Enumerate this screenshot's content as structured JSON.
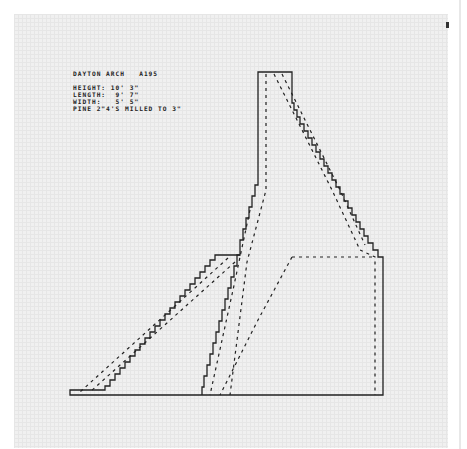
{
  "drawing": {
    "title": "DAYTON ARCH",
    "code": "A195",
    "specs": [
      {
        "label": "HEIGHT:",
        "value": "10' 3\""
      },
      {
        "label": "LENGTH:",
        "value": "9' 7\""
      },
      {
        "label": "WIDTH:",
        "value": "5' 5\""
      }
    ],
    "material": "PINE 2\"4'S MILLED TO 3\""
  },
  "colors": {
    "ink": "#222222",
    "paper": "#f0f0f0",
    "grid": "#e6e6e6"
  }
}
